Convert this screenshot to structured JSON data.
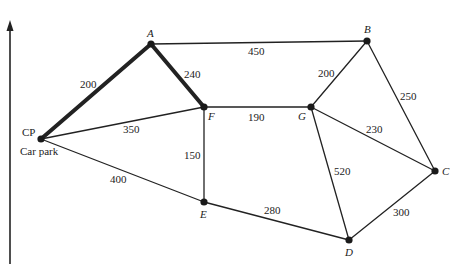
{
  "diagram": {
    "type": "weighted-network",
    "axis": {
      "x": 10,
      "y_top": 20,
      "y_bottom": 264
    },
    "nodes": [
      {
        "id": "CP",
        "label": "CP",
        "sublabel": "Car park",
        "x": 41,
        "y": 139,
        "lx": 22,
        "ly": 136,
        "italic": false
      },
      {
        "id": "A",
        "label": "A",
        "x": 151,
        "y": 44,
        "lx": 147,
        "ly": 37,
        "italic": true
      },
      {
        "id": "F",
        "label": "F",
        "x": 204,
        "y": 107,
        "lx": 208,
        "ly": 120,
        "italic": true
      },
      {
        "id": "B",
        "label": "B",
        "x": 367,
        "y": 41,
        "lx": 364,
        "ly": 33,
        "italic": true
      },
      {
        "id": "G",
        "label": "G",
        "x": 311,
        "y": 107,
        "lx": 298,
        "ly": 120,
        "italic": true
      },
      {
        "id": "C",
        "label": "C",
        "x": 435,
        "y": 171,
        "lx": 442,
        "ly": 175,
        "italic": true
      },
      {
        "id": "D",
        "label": "D",
        "x": 349,
        "y": 240,
        "lx": 345,
        "ly": 256,
        "italic": true
      },
      {
        "id": "E",
        "label": "E",
        "x": 204,
        "y": 202,
        "lx": 200,
        "ly": 218,
        "italic": true
      }
    ],
    "edges": [
      {
        "from": "CP",
        "to": "A",
        "weight": "200",
        "bold": true,
        "wx": 80,
        "wy": 88
      },
      {
        "from": "A",
        "to": "F",
        "weight": "240",
        "bold": true,
        "wx": 184,
        "wy": 78
      },
      {
        "from": "A",
        "to": "B",
        "weight": "450",
        "bold": false,
        "wx": 248,
        "wy": 55
      },
      {
        "from": "CP",
        "to": "F",
        "weight": "350",
        "bold": false,
        "wx": 123,
        "wy": 133
      },
      {
        "from": "CP",
        "to": "E",
        "weight": "400",
        "bold": false,
        "wx": 110,
        "wy": 183
      },
      {
        "from": "F",
        "to": "G",
        "weight": "190",
        "bold": false,
        "wx": 248,
        "wy": 121
      },
      {
        "from": "F",
        "to": "E",
        "weight": "150",
        "bold": false,
        "wx": 184,
        "wy": 159
      },
      {
        "from": "G",
        "to": "B",
        "weight": "200",
        "bold": false,
        "wx": 318,
        "wy": 77
      },
      {
        "from": "B",
        "to": "C",
        "weight": "250",
        "bold": false,
        "wx": 400,
        "wy": 100
      },
      {
        "from": "G",
        "to": "C",
        "weight": "230",
        "bold": false,
        "wx": 366,
        "wy": 133
      },
      {
        "from": "G",
        "to": "D",
        "weight": "520",
        "bold": false,
        "wx": 334,
        "wy": 175
      },
      {
        "from": "E",
        "to": "D",
        "weight": "280",
        "bold": false,
        "wx": 264,
        "wy": 214
      },
      {
        "from": "D",
        "to": "C",
        "weight": "300",
        "bold": false,
        "wx": 393,
        "wy": 216
      }
    ]
  }
}
